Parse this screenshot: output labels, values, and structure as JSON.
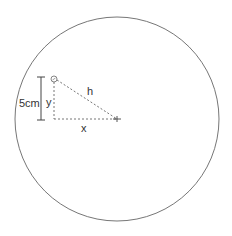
{
  "diagram": {
    "labels": {
      "height_measure": "5cm",
      "vertical_leg": "y",
      "horizontal_leg": "x",
      "hypotenuse": "h"
    },
    "circle": {
      "cx": 117,
      "cy": 119,
      "r": 102,
      "stroke": "#666666"
    },
    "triangle": {
      "top_point": {
        "x": 54,
        "y": 79
      },
      "corner": {
        "x": 54,
        "y": 119
      },
      "center_mark": {
        "x": 117,
        "y": 119
      },
      "stroke": "#666666"
    },
    "measure_bar": {
      "x": 41,
      "y1": 77,
      "y2": 120
    }
  }
}
